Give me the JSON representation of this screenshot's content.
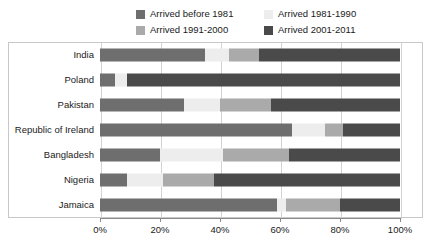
{
  "chart_data": {
    "type": "bar",
    "orientation": "horizontal",
    "stacked": true,
    "stacked_mode": "percent",
    "title": "",
    "subtitle": "",
    "xlabel": "",
    "ylabel": "",
    "xlim": [
      0,
      100
    ],
    "xticks": [
      0,
      20,
      40,
      60,
      80,
      100
    ],
    "xticklabels": [
      "0%",
      "20%",
      "40%",
      "60%",
      "80%",
      "100%"
    ],
    "grid": true,
    "grid_axis": "x",
    "legend_position": "top",
    "categories": [
      "India",
      "Poland",
      "Pakistan",
      "Republic of Ireland",
      "Bangladesh",
      "Nigeria",
      "Jamaica"
    ],
    "series": [
      {
        "name": "Arrived before 1981",
        "color": "#6e6e6e",
        "values": [
          35,
          5,
          28,
          64,
          20,
          9,
          59
        ]
      },
      {
        "name": "Arrived 1981-1990",
        "color": "#ededed",
        "values": [
          8,
          4,
          12,
          11,
          21,
          12,
          3
        ]
      },
      {
        "name": "Arrived 1991-2000",
        "color": "#aaaaaa",
        "values": [
          10,
          0,
          17,
          6,
          22,
          17,
          18
        ]
      },
      {
        "name": "Arrived 2001-2011",
        "color": "#4a4a4a",
        "values": [
          47,
          91,
          43,
          19,
          37,
          62,
          20
        ]
      }
    ]
  },
  "legend": {
    "entries": [
      {
        "label": "Arrived before 1981",
        "swatch": "#6e6e6e"
      },
      {
        "label": "Arrived 1981-1990",
        "swatch": "#ededed"
      },
      {
        "label": "Arrived 1991-2000",
        "swatch": "#aaaaaa"
      },
      {
        "label": "Arrived 2001-2011",
        "swatch": "#4a4a4a"
      }
    ]
  },
  "colors": {
    "frame_border": "#c8c8c8",
    "gridline": "#d2d2d2",
    "axis_line": "#8a8a8a",
    "text": "#1a1a1a",
    "background": "#ffffff"
  }
}
